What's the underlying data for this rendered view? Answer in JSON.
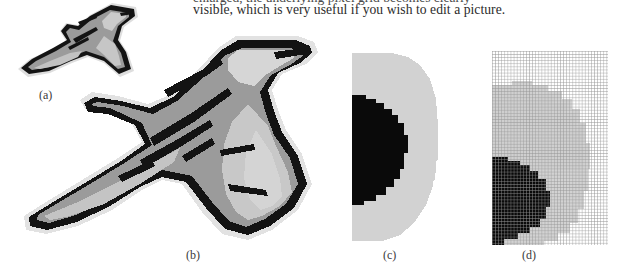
{
  "page": {
    "background_color": "#ffffff",
    "width": 619,
    "height": 267
  },
  "body_text": {
    "line_clipped": "enlarged, the underlying pixel grid becomes clearly",
    "line_visible": "visible, which is very useful if you wish to edit a picture."
  },
  "figure": {
    "panels": [
      {
        "id": "a",
        "caption": "(a)",
        "description": "bird-clipart-original",
        "colors": {
          "outline": "#111111",
          "body_gray": "#9b9b9b",
          "highlight_gray": "#c9c9c9",
          "pale_gray": "#dedede",
          "background": "#ffffff"
        }
      },
      {
        "id": "b",
        "caption": "(b)",
        "description": "bird-clipart-magnified-pixelated",
        "colors": {
          "outline": "#111111",
          "body_gray": "#9b9b9b",
          "highlight_gray": "#c9c9c9",
          "pale_gray": "#dedede",
          "background": "#ffffff"
        }
      },
      {
        "id": "c",
        "caption": "(c)",
        "description": "detail-zoom-blob-no-grid",
        "colors": {
          "dark_blob": "#0a0a0a",
          "light_gray": "#d2d2d2",
          "background": "#ffffff"
        }
      },
      {
        "id": "d",
        "caption": "(d)",
        "description": "detail-zoom-blob-with-pixel-grid",
        "colors": {
          "dark_blob": "#0a0a0a",
          "light_gray": "#d2d2d2",
          "grid_line": "#969696",
          "background": "#ffffff"
        }
      }
    ]
  }
}
